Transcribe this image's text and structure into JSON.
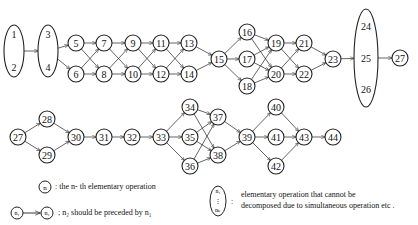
{
  "diagram": {
    "title": "",
    "stroke_color": "#222222",
    "nodes": [
      {
        "id": "1-2",
        "labels": [
          "1",
          "2"
        ],
        "cx": 14,
        "cy": 51,
        "rx": 10,
        "ry": 26
      },
      {
        "id": "3-4",
        "labels": [
          "3",
          "4"
        ],
        "cx": 48,
        "cy": 51,
        "rx": 10,
        "ry": 26
      },
      {
        "id": "5",
        "labels": [
          "5"
        ],
        "cx": 76,
        "cy": 43,
        "rx": 8,
        "ry": 8
      },
      {
        "id": "6",
        "labels": [
          "6"
        ],
        "cx": 76,
        "cy": 74,
        "rx": 8,
        "ry": 8
      },
      {
        "id": "7",
        "labels": [
          "7"
        ],
        "cx": 104,
        "cy": 43,
        "rx": 8,
        "ry": 8
      },
      {
        "id": "8",
        "labels": [
          "8"
        ],
        "cx": 104,
        "cy": 74,
        "rx": 8,
        "ry": 8
      },
      {
        "id": "9",
        "labels": [
          "9"
        ],
        "cx": 133,
        "cy": 43,
        "rx": 8,
        "ry": 8
      },
      {
        "id": "10",
        "labels": [
          "10"
        ],
        "cx": 133,
        "cy": 74,
        "rx": 8,
        "ry": 8
      },
      {
        "id": "11",
        "labels": [
          "11"
        ],
        "cx": 161,
        "cy": 43,
        "rx": 8,
        "ry": 8
      },
      {
        "id": "12",
        "labels": [
          "12"
        ],
        "cx": 161,
        "cy": 74,
        "rx": 8,
        "ry": 8
      },
      {
        "id": "13",
        "labels": [
          "13"
        ],
        "cx": 189,
        "cy": 43,
        "rx": 8,
        "ry": 8
      },
      {
        "id": "14",
        "labels": [
          "14"
        ],
        "cx": 189,
        "cy": 74,
        "rx": 8,
        "ry": 8
      },
      {
        "id": "15",
        "labels": [
          "15"
        ],
        "cx": 219,
        "cy": 59,
        "rx": 8,
        "ry": 8
      },
      {
        "id": "16",
        "labels": [
          "16"
        ],
        "cx": 247,
        "cy": 32,
        "rx": 8,
        "ry": 8
      },
      {
        "id": "17",
        "labels": [
          "17"
        ],
        "cx": 247,
        "cy": 59,
        "rx": 8,
        "ry": 8
      },
      {
        "id": "18",
        "labels": [
          "18"
        ],
        "cx": 247,
        "cy": 86,
        "rx": 8,
        "ry": 8
      },
      {
        "id": "19",
        "labels": [
          "19"
        ],
        "cx": 276,
        "cy": 43,
        "rx": 8,
        "ry": 8
      },
      {
        "id": "20",
        "labels": [
          "20"
        ],
        "cx": 276,
        "cy": 74,
        "rx": 8,
        "ry": 8
      },
      {
        "id": "21",
        "labels": [
          "21"
        ],
        "cx": 304,
        "cy": 43,
        "rx": 8,
        "ry": 8
      },
      {
        "id": "22",
        "labels": [
          "22"
        ],
        "cx": 304,
        "cy": 74,
        "rx": 8,
        "ry": 8
      },
      {
        "id": "23",
        "labels": [
          "23"
        ],
        "cx": 333,
        "cy": 59,
        "rx": 8,
        "ry": 8
      },
      {
        "id": "24-26",
        "labels": [
          "24",
          "25",
          "26"
        ],
        "cx": 366,
        "cy": 58,
        "rx": 12,
        "ry": 49
      },
      {
        "id": "27a",
        "labels": [
          "27"
        ],
        "cx": 400,
        "cy": 58,
        "rx": 8,
        "ry": 8
      },
      {
        "id": "27b",
        "labels": [
          "27"
        ],
        "cx": 18,
        "cy": 137,
        "rx": 8,
        "ry": 8
      },
      {
        "id": "28",
        "labels": [
          "28"
        ],
        "cx": 47,
        "cy": 119,
        "rx": 8,
        "ry": 8
      },
      {
        "id": "29",
        "labels": [
          "29"
        ],
        "cx": 47,
        "cy": 155,
        "rx": 8,
        "ry": 8
      },
      {
        "id": "30",
        "labels": [
          "30"
        ],
        "cx": 76,
        "cy": 137,
        "rx": 8,
        "ry": 8
      },
      {
        "id": "31",
        "labels": [
          "31"
        ],
        "cx": 104,
        "cy": 137,
        "rx": 8,
        "ry": 8
      },
      {
        "id": "32",
        "labels": [
          "32"
        ],
        "cx": 132,
        "cy": 137,
        "rx": 8,
        "ry": 8
      },
      {
        "id": "33",
        "labels": [
          "33"
        ],
        "cx": 161,
        "cy": 137,
        "rx": 8,
        "ry": 8
      },
      {
        "id": "34",
        "labels": [
          "34"
        ],
        "cx": 190,
        "cy": 107,
        "rx": 8,
        "ry": 8
      },
      {
        "id": "35",
        "labels": [
          "35"
        ],
        "cx": 190,
        "cy": 137,
        "rx": 8,
        "ry": 8
      },
      {
        "id": "36",
        "labels": [
          "36"
        ],
        "cx": 190,
        "cy": 166,
        "rx": 8,
        "ry": 8
      },
      {
        "id": "37",
        "labels": [
          "37"
        ],
        "cx": 218,
        "cy": 117,
        "rx": 8,
        "ry": 8
      },
      {
        "id": "38",
        "labels": [
          "38"
        ],
        "cx": 218,
        "cy": 155,
        "rx": 8,
        "ry": 8
      },
      {
        "id": "39",
        "labels": [
          "39"
        ],
        "cx": 247,
        "cy": 137,
        "rx": 8,
        "ry": 8
      },
      {
        "id": "40",
        "labels": [
          "40"
        ],
        "cx": 276,
        "cy": 107,
        "rx": 8,
        "ry": 8
      },
      {
        "id": "41",
        "labels": [
          "41"
        ],
        "cx": 276,
        "cy": 137,
        "rx": 8,
        "ry": 8
      },
      {
        "id": "42",
        "labels": [
          "42"
        ],
        "cx": 276,
        "cy": 166,
        "rx": 8,
        "ry": 8
      },
      {
        "id": "43",
        "labels": [
          "43"
        ],
        "cx": 304,
        "cy": 137,
        "rx": 8,
        "ry": 8
      },
      {
        "id": "44",
        "labels": [
          "44"
        ],
        "cx": 333,
        "cy": 137,
        "rx": 8,
        "ry": 8
      }
    ],
    "edges": [
      [
        "1-2",
        "3-4"
      ],
      [
        "3-4",
        "5"
      ],
      [
        "3-4",
        "6"
      ],
      [
        "5",
        "7"
      ],
      [
        "5",
        "8"
      ],
      [
        "6",
        "7"
      ],
      [
        "6",
        "8"
      ],
      [
        "7",
        "9"
      ],
      [
        "7",
        "10"
      ],
      [
        "8",
        "9"
      ],
      [
        "8",
        "10"
      ],
      [
        "9",
        "11"
      ],
      [
        "9",
        "12"
      ],
      [
        "10",
        "11"
      ],
      [
        "10",
        "12"
      ],
      [
        "11",
        "13"
      ],
      [
        "11",
        "14"
      ],
      [
        "12",
        "13"
      ],
      [
        "12",
        "14"
      ],
      [
        "13",
        "15"
      ],
      [
        "14",
        "15"
      ],
      [
        "15",
        "16"
      ],
      [
        "15",
        "17"
      ],
      [
        "15",
        "18"
      ],
      [
        "16",
        "19"
      ],
      [
        "16",
        "20"
      ],
      [
        "17",
        "19"
      ],
      [
        "17",
        "20"
      ],
      [
        "18",
        "19"
      ],
      [
        "18",
        "20"
      ],
      [
        "19",
        "21"
      ],
      [
        "19",
        "22"
      ],
      [
        "20",
        "21"
      ],
      [
        "20",
        "22"
      ],
      [
        "21",
        "23"
      ],
      [
        "22",
        "23"
      ],
      [
        "23",
        "24-26"
      ],
      [
        "24-26",
        "27a"
      ],
      [
        "27b",
        "28"
      ],
      [
        "27b",
        "29"
      ],
      [
        "28",
        "30"
      ],
      [
        "29",
        "30"
      ],
      [
        "30",
        "31"
      ],
      [
        "31",
        "32"
      ],
      [
        "32",
        "33"
      ],
      [
        "33",
        "34"
      ],
      [
        "33",
        "35"
      ],
      [
        "33",
        "36"
      ],
      [
        "34",
        "37"
      ],
      [
        "34",
        "38"
      ],
      [
        "35",
        "37"
      ],
      [
        "35",
        "38"
      ],
      [
        "36",
        "37"
      ],
      [
        "36",
        "38"
      ],
      [
        "37",
        "39"
      ],
      [
        "38",
        "39"
      ],
      [
        "39",
        "40"
      ],
      [
        "39",
        "41"
      ],
      [
        "39",
        "42"
      ],
      [
        "40",
        "43"
      ],
      [
        "41",
        "43"
      ],
      [
        "42",
        "43"
      ],
      [
        "43",
        "44"
      ]
    ]
  },
  "legend": {
    "node_symbol": "n",
    "node_desc": ": the n- th elementary operation",
    "arrow_from": "n₁",
    "arrow_to": "n₂",
    "arrow_desc": "; n₂  should be preceded by   n₁",
    "group_top": "n₁",
    "group_bottom": "nₖ",
    "group_desc_line1": "elementary operation that cannot be",
    "group_desc_line2": "decomposed due to simultaneous operation  etc ."
  }
}
